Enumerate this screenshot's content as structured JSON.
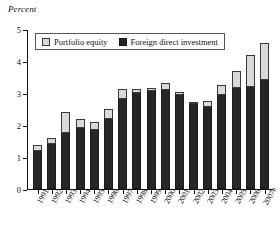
{
  "chart_data": {
    "type": "bar",
    "stacked": true,
    "title": "",
    "ylabel": "Percent",
    "xlabel": "",
    "ylim": [
      0,
      5
    ],
    "yticks": [
      0,
      1,
      2,
      3,
      4,
      5
    ],
    "ytick_labels": [
      "0",
      "1",
      "2",
      "3",
      "4",
      "5"
    ],
    "grid": false,
    "legend_position": "top-inside",
    "categories": [
      "1991",
      "1992",
      "1993",
      "1994",
      "1995",
      "1996",
      "1997",
      "1998",
      "1999",
      "2000",
      "2001",
      "2002",
      "2003",
      "2004",
      "2005",
      "2006",
      "2007e"
    ],
    "series": [
      {
        "name": "Foreign direct investment",
        "color": "#262626",
        "values": [
          1.18,
          1.4,
          1.75,
          1.92,
          1.85,
          2.2,
          2.82,
          3.0,
          3.05,
          3.1,
          2.95,
          2.65,
          2.55,
          2.95,
          3.15,
          3.2,
          3.4
        ]
      },
      {
        "name": "Portfolio equity",
        "color": "#d9d9d9",
        "values": [
          0.2,
          0.2,
          0.65,
          0.28,
          0.25,
          0.3,
          0.3,
          0.12,
          0.1,
          0.2,
          0.08,
          0.05,
          0.2,
          0.3,
          0.55,
          1.0,
          1.15
        ]
      }
    ],
    "totals": [
      1.38,
      1.6,
      2.4,
      2.2,
      2.1,
      2.5,
      3.12,
      3.12,
      3.15,
      3.3,
      3.03,
      2.7,
      2.75,
      3.25,
      3.7,
      4.2,
      4.55
    ]
  },
  "legend": {
    "items": [
      {
        "label": "Portfolio equity",
        "swatch": "portfolio-swatch"
      },
      {
        "label": "Foreign direct investment",
        "swatch": "fdi-swatch"
      }
    ]
  }
}
